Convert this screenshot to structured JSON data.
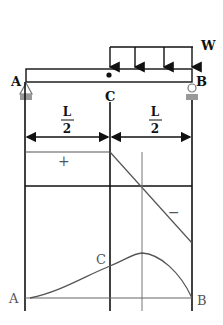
{
  "figure": {
    "load_label": "W",
    "support_left_label": "A",
    "support_right_label": "B",
    "midpoint_label": "C",
    "span_left": {
      "numerator": "L",
      "denominator": "2"
    },
    "span_right": {
      "numerator": "L",
      "denominator": "2"
    },
    "shear_positive_sign": "+",
    "shear_negative_sign": "−",
    "moment_label_left": "A",
    "moment_label_mid": "C",
    "moment_label_right": "B",
    "colors": {
      "ink": "#111111",
      "diagram_line": "#555555",
      "support": "#888888"
    }
  }
}
